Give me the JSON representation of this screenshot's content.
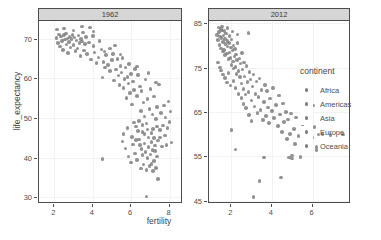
{
  "chart_data": {
    "type": "scatter",
    "title": "",
    "xlabel": "fertility",
    "ylabel": "life_expectancy",
    "grid": true,
    "legend_position": "right",
    "legend": {
      "title": "continent",
      "entries": [
        "Africa",
        "Americas",
        "Asia",
        "Europe",
        "Oceania"
      ]
    },
    "point_color": "#7f7f7f",
    "strip_bg_color": "#d6d6d6",
    "panel_bg_color": "#ffffff",
    "facets": [
      {
        "label": "1962",
        "xlim": [
          1.2,
          8.7
        ],
        "ylim": [
          28.5,
          74.5
        ],
        "xticks": [
          "2",
          "4",
          "6",
          "8"
        ],
        "xtick_values": [
          2,
          4,
          6,
          8
        ],
        "yticks": [
          "30",
          "40",
          "50",
          "60",
          "70"
        ],
        "ytick_values": [
          30,
          40,
          50,
          60,
          70
        ],
        "points": [
          [
            2.1,
            70.2
          ],
          [
            2.2,
            69.0
          ],
          [
            2.25,
            71.1
          ],
          [
            2.3,
            68.1
          ],
          [
            2.35,
            70.6
          ],
          [
            2.4,
            69.5
          ],
          [
            2.45,
            67.2
          ],
          [
            2.5,
            70.9
          ],
          [
            2.55,
            69.8
          ],
          [
            2.6,
            71.4
          ],
          [
            2.62,
            68.6
          ],
          [
            2.68,
            70.1
          ],
          [
            2.7,
            66.4
          ],
          [
            2.75,
            69.2
          ],
          [
            2.8,
            70.5
          ],
          [
            2.85,
            67.8
          ],
          [
            2.9,
            69.9
          ],
          [
            2.95,
            71.0
          ],
          [
            3.0,
            68.4
          ],
          [
            3.05,
            70.3
          ],
          [
            3.1,
            66.9
          ],
          [
            3.15,
            69.6
          ],
          [
            3.2,
            67.5
          ],
          [
            3.25,
            70.8
          ],
          [
            3.3,
            68.9
          ],
          [
            3.35,
            65.6
          ],
          [
            3.4,
            70.0
          ],
          [
            3.45,
            69.3
          ],
          [
            3.5,
            71.6
          ],
          [
            3.55,
            67.1
          ],
          [
            3.6,
            68.7
          ],
          [
            3.65,
            70.4
          ],
          [
            3.7,
            66.2
          ],
          [
            3.8,
            69.1
          ],
          [
            3.85,
            72.9
          ],
          [
            3.9,
            64.8
          ],
          [
            4.0,
            70.7
          ],
          [
            4.05,
            68.2
          ],
          [
            4.1,
            66.6
          ],
          [
            4.2,
            63.9
          ],
          [
            4.3,
            65.3
          ],
          [
            4.35,
            69.4
          ],
          [
            4.45,
            67.3
          ],
          [
            4.5,
            60.2
          ],
          [
            4.55,
            64.1
          ],
          [
            4.6,
            66.8
          ],
          [
            4.65,
            62.7
          ],
          [
            4.7,
            65.9
          ],
          [
            4.8,
            63.4
          ],
          [
            4.9,
            61.8
          ],
          [
            5.0,
            64.6
          ],
          [
            5.05,
            66.1
          ],
          [
            5.1,
            59.4
          ],
          [
            5.2,
            62.2
          ],
          [
            5.3,
            64.9
          ],
          [
            5.35,
            60.7
          ],
          [
            5.4,
            58.3
          ],
          [
            5.45,
            63.1
          ],
          [
            5.5,
            61.5
          ],
          [
            5.55,
            65.2
          ],
          [
            5.6,
            57.6
          ],
          [
            5.65,
            59.9
          ],
          [
            5.7,
            62.8
          ],
          [
            5.75,
            55.1
          ],
          [
            5.8,
            60.4
          ],
          [
            5.85,
            58.7
          ],
          [
            5.9,
            63.6
          ],
          [
            5.95,
            56.3
          ],
          [
            6.0,
            61.1
          ],
          [
            6.05,
            53.4
          ],
          [
            6.1,
            59.2
          ],
          [
            6.15,
            57.0
          ],
          [
            6.2,
            62.4
          ],
          [
            6.25,
            47.8
          ],
          [
            6.3,
            55.6
          ],
          [
            6.35,
            60.9
          ],
          [
            6.4,
            49.2
          ],
          [
            6.45,
            58.0
          ],
          [
            6.5,
            51.7
          ],
          [
            6.55,
            56.8
          ],
          [
            6.6,
            46.4
          ],
          [
            6.65,
            53.9
          ],
          [
            6.7,
            50.3
          ],
          [
            6.75,
            59.7
          ],
          [
            6.8,
            48.6
          ],
          [
            6.85,
            54.8
          ],
          [
            6.9,
            45.1
          ],
          [
            6.95,
            52.2
          ],
          [
            7.0,
            57.3
          ],
          [
            7.05,
            43.9
          ],
          [
            7.1,
            50.9
          ],
          [
            7.15,
            47.2
          ],
          [
            7.2,
            55.4
          ],
          [
            7.25,
            41.6
          ],
          [
            7.3,
            49.7
          ],
          [
            7.35,
            52.8
          ],
          [
            7.4,
            44.3
          ],
          [
            7.45,
            58.4
          ],
          [
            7.5,
            46.9
          ],
          [
            7.55,
            51.2
          ],
          [
            7.6,
            42.8
          ],
          [
            7.65,
            48.1
          ],
          [
            7.7,
            53.2
          ],
          [
            7.75,
            45.6
          ],
          [
            7.8,
            50.1
          ],
          [
            7.85,
            43.2
          ],
          [
            7.9,
            47.4
          ],
          [
            7.95,
            54.2
          ],
          [
            8.0,
            49.0
          ],
          [
            8.05,
            51.6
          ],
          [
            8.1,
            43.8
          ],
          [
            5.55,
            44.1
          ],
          [
            5.7,
            42.3
          ],
          [
            5.85,
            40.2
          ],
          [
            6.0,
            38.7
          ],
          [
            6.1,
            43.3
          ],
          [
            6.2,
            41.0
          ],
          [
            6.3,
            39.4
          ],
          [
            6.4,
            44.6
          ],
          [
            6.5,
            37.2
          ],
          [
            6.55,
            42.1
          ],
          [
            6.6,
            40.6
          ],
          [
            6.65,
            38.2
          ],
          [
            6.7,
            43.5
          ],
          [
            6.75,
            41.4
          ],
          [
            6.8,
            36.8
          ],
          [
            6.85,
            39.9
          ],
          [
            6.9,
            42.6
          ],
          [
            6.95,
            37.9
          ],
          [
            7.0,
            40.8
          ],
          [
            7.05,
            38.4
          ],
          [
            7.1,
            41.9
          ],
          [
            7.15,
            36.6
          ],
          [
            7.2,
            39.1
          ],
          [
            7.25,
            43.0
          ],
          [
            7.3,
            37.4
          ],
          [
            7.35,
            40.3
          ],
          [
            7.4,
            34.6
          ],
          [
            6.8,
            30.2
          ],
          [
            4.5,
            39.6
          ],
          [
            5.6,
            46.0
          ],
          [
            5.8,
            47.5
          ],
          [
            6.05,
            45.2
          ],
          [
            6.15,
            48.9
          ],
          [
            6.25,
            44.4
          ],
          [
            6.35,
            46.7
          ],
          [
            6.45,
            43.1
          ],
          [
            6.6,
            48.2
          ],
          [
            6.7,
            45.9
          ],
          [
            6.85,
            47.1
          ],
          [
            7.05,
            46.2
          ],
          [
            7.2,
            44.9
          ],
          [
            7.35,
            47.8
          ],
          [
            7.5,
            45.0
          ],
          [
            2.15,
            72.3
          ],
          [
            2.5,
            72.6
          ],
          [
            3.0,
            72.1
          ],
          [
            3.45,
            73.1
          ],
          [
            4.05,
            71.9
          ],
          [
            4.9,
            67.6
          ],
          [
            5.15,
            68.3
          ],
          [
            5.45,
            66.0
          ],
          [
            6.3,
            63.0
          ],
          [
            6.9,
            61.3
          ],
          [
            7.3,
            59.0
          ]
        ]
      },
      {
        "label": "2012",
        "xlim": [
          0.9,
          7.9
        ],
        "ylim": [
          44.5,
          85.5
        ],
        "xticks": [
          "2",
          "4",
          "6"
        ],
        "xtick_values": [
          2,
          4,
          6
        ],
        "yticks": [
          "45",
          "55",
          "65",
          "75",
          "85"
        ],
        "ytick_values": [
          45,
          55,
          65,
          75,
          85
        ],
        "points": [
          [
            1.3,
            82.4
          ],
          [
            1.35,
            81.2
          ],
          [
            1.4,
            83.0
          ],
          [
            1.42,
            80.1
          ],
          [
            1.45,
            82.0
          ],
          [
            1.5,
            79.3
          ],
          [
            1.52,
            81.7
          ],
          [
            1.55,
            83.4
          ],
          [
            1.58,
            78.6
          ],
          [
            1.6,
            80.8
          ],
          [
            1.62,
            82.2
          ],
          [
            1.65,
            79.0
          ],
          [
            1.68,
            81.4
          ],
          [
            1.7,
            77.8
          ],
          [
            1.72,
            80.3
          ],
          [
            1.75,
            82.7
          ],
          [
            1.78,
            78.2
          ],
          [
            1.8,
            79.8
          ],
          [
            1.82,
            81.0
          ],
          [
            1.85,
            76.9
          ],
          [
            1.88,
            80.5
          ],
          [
            1.9,
            78.4
          ],
          [
            1.92,
            82.1
          ],
          [
            1.95,
            77.2
          ],
          [
            1.98,
            79.5
          ],
          [
            2.0,
            75.6
          ],
          [
            2.02,
            81.3
          ],
          [
            2.05,
            78.9
          ],
          [
            2.08,
            76.4
          ],
          [
            2.1,
            80.0
          ],
          [
            2.12,
            74.8
          ],
          [
            2.15,
            77.5
          ],
          [
            2.18,
            79.2
          ],
          [
            2.2,
            75.1
          ],
          [
            2.22,
            78.0
          ],
          [
            2.25,
            73.6
          ],
          [
            2.28,
            76.7
          ],
          [
            2.3,
            80.6
          ],
          [
            2.35,
            74.2
          ],
          [
            2.4,
            77.1
          ],
          [
            2.42,
            72.9
          ],
          [
            2.45,
            75.9
          ],
          [
            2.5,
            71.4
          ],
          [
            2.52,
            78.3
          ],
          [
            2.55,
            74.6
          ],
          [
            2.6,
            70.2
          ],
          [
            2.62,
            76.2
          ],
          [
            2.65,
            73.0
          ],
          [
            2.7,
            68.9
          ],
          [
            2.75,
            75.4
          ],
          [
            2.8,
            71.8
          ],
          [
            2.85,
            69.5
          ],
          [
            2.9,
            74.0
          ],
          [
            2.95,
            72.3
          ],
          [
            3.0,
            67.6
          ],
          [
            3.05,
            70.8
          ],
          [
            3.1,
            73.4
          ],
          [
            3.15,
            66.2
          ],
          [
            3.2,
            69.1
          ],
          [
            3.25,
            71.9
          ],
          [
            3.3,
            64.8
          ],
          [
            3.35,
            68.4
          ],
          [
            3.4,
            72.6
          ],
          [
            3.45,
            65.5
          ],
          [
            3.5,
            70.0
          ],
          [
            3.55,
            63.2
          ],
          [
            3.6,
            67.2
          ],
          [
            3.65,
            71.1
          ],
          [
            3.7,
            64.1
          ],
          [
            3.75,
            69.7
          ],
          [
            3.8,
            66.0
          ],
          [
            3.85,
            62.5
          ],
          [
            3.9,
            68.0
          ],
          [
            4.0,
            65.2
          ],
          [
            4.05,
            70.4
          ],
          [
            4.1,
            63.7
          ],
          [
            4.2,
            66.6
          ],
          [
            4.3,
            61.9
          ],
          [
            4.35,
            68.7
          ],
          [
            4.4,
            64.4
          ],
          [
            4.5,
            60.5
          ],
          [
            4.55,
            66.9
          ],
          [
            4.6,
            62.8
          ],
          [
            4.7,
            65.0
          ],
          [
            4.75,
            58.9
          ],
          [
            4.8,
            63.3
          ],
          [
            4.9,
            60.1
          ],
          [
            4.95,
            64.7
          ],
          [
            5.0,
            55.2
          ],
          [
            5.1,
            61.2
          ],
          [
            5.15,
            57.8
          ],
          [
            5.2,
            63.8
          ],
          [
            5.3,
            59.6
          ],
          [
            5.4,
            54.9
          ],
          [
            5.5,
            62.0
          ],
          [
            5.6,
            58.2
          ],
          [
            5.7,
            60.8
          ],
          [
            5.8,
            56.4
          ],
          [
            5.9,
            63.1
          ],
          [
            6.0,
            59.3
          ],
          [
            6.05,
            66.5
          ],
          [
            6.1,
            61.6
          ],
          [
            6.2,
            57.1
          ],
          [
            6.3,
            59.9
          ],
          [
            6.5,
            60.0
          ],
          [
            6.9,
            59.8
          ],
          [
            7.5,
            59.9
          ],
          [
            1.38,
            84.0
          ],
          [
            1.48,
            83.7
          ],
          [
            1.55,
            84.3
          ],
          [
            1.66,
            83.2
          ],
          [
            1.8,
            83.9
          ],
          [
            2.05,
            83.1
          ],
          [
            2.3,
            82.5
          ],
          [
            2.85,
            82.8
          ],
          [
            1.35,
            76.2
          ],
          [
            1.45,
            75.0
          ],
          [
            1.5,
            74.3
          ],
          [
            1.6,
            73.5
          ],
          [
            1.7,
            72.7
          ],
          [
            1.78,
            71.6
          ],
          [
            1.85,
            73.8
          ],
          [
            1.95,
            71.0
          ],
          [
            2.1,
            72.0
          ],
          [
            2.2,
            70.4
          ],
          [
            2.35,
            69.0
          ],
          [
            2.5,
            68.2
          ],
          [
            2.6,
            66.8
          ],
          [
            2.72,
            65.9
          ],
          [
            2.88,
            64.3
          ],
          [
            3.0,
            63.0
          ],
          [
            2.0,
            60.9
          ],
          [
            2.2,
            56.5
          ],
          [
            3.1,
            45.9
          ],
          [
            3.4,
            49.5
          ],
          [
            4.45,
            50.2
          ],
          [
            3.6,
            54.8
          ],
          [
            4.85,
            54.8
          ],
          [
            5.0,
            54.5
          ],
          [
            6.2,
            56.4
          ]
        ]
      }
    ]
  }
}
